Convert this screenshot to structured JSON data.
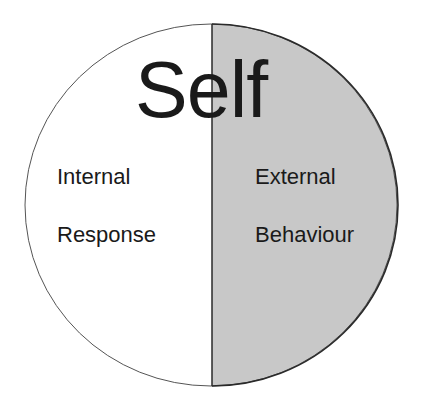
{
  "diagram": {
    "title": "Self",
    "left_half": {
      "line1": "Internal",
      "line2": "Response",
      "fill": "#ffffff"
    },
    "right_half": {
      "line1": "External",
      "line2": "Behaviour",
      "fill": "#c8c8c8"
    },
    "stroke": "#2a2a2a"
  }
}
